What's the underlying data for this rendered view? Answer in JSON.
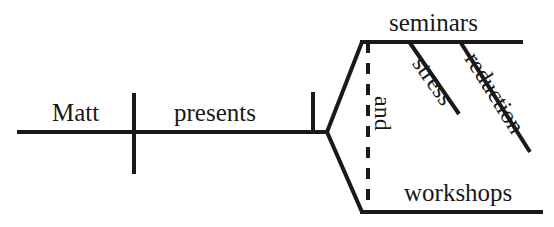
{
  "diagram": {
    "type": "reed-kellogg-sentence-diagram",
    "sentence": "Matt presents seminars and workshops stress reduction",
    "ink_color": "#1a1a1a",
    "background_color": "#ffffff",
    "labels": {
      "subject": "Matt",
      "verb": "presents",
      "object_upper": "seminars",
      "object_lower": "workshops",
      "conjunction": "and",
      "modifier_one": "stress",
      "modifier_two": "reduction"
    },
    "lines": {
      "baseline": "horizontal-baseline",
      "subject_verb_divider": "vertical-full-crossing-tick",
      "verb_object_divider": "vertical-half-tick",
      "upper_branch": "diagonal-up-to-seminars",
      "lower_branch": "diagonal-down-to-workshops",
      "seminars_line": "horizontal-upper",
      "workshops_line": "horizontal-lower",
      "conjunction_line": "dashed-vertical",
      "stress_line": "diagonal-modifier",
      "reduction_line": "diagonal-modifier"
    }
  }
}
